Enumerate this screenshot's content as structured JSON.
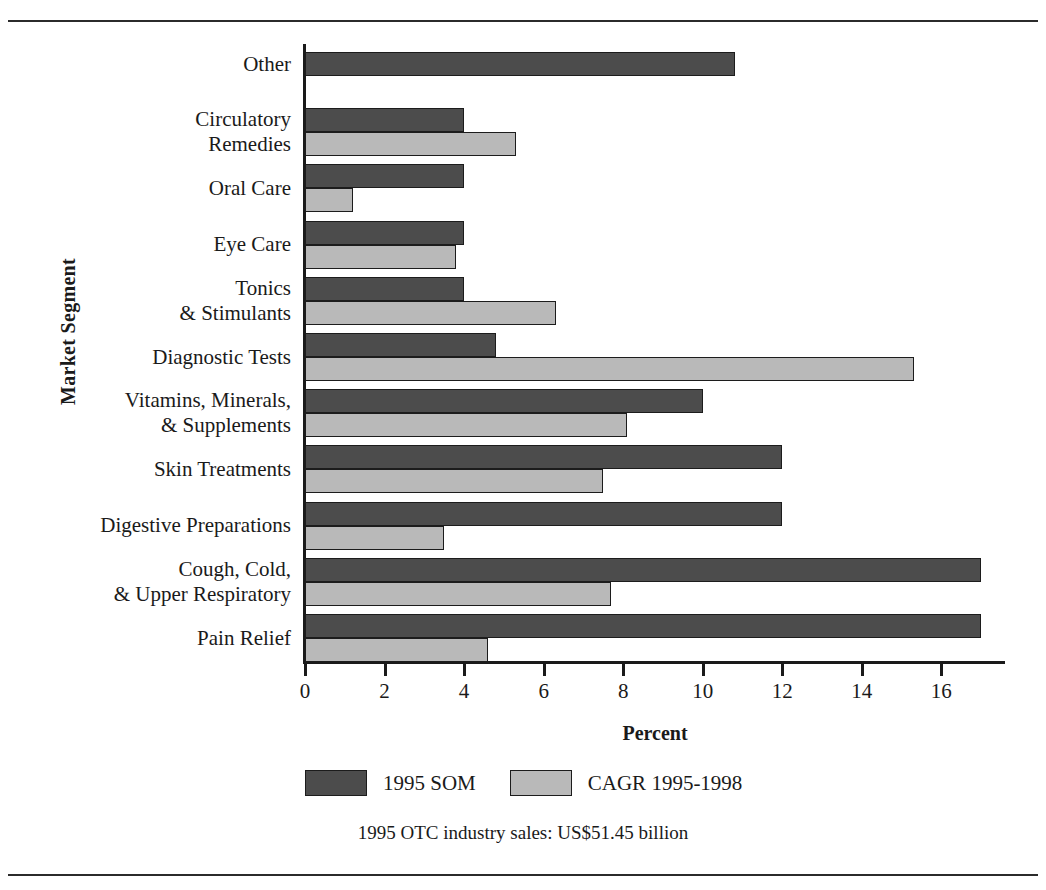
{
  "chart_data": {
    "type": "bar",
    "orientation": "horizontal",
    "title": "",
    "xlabel": "Percent",
    "ylabel": "Market Segment",
    "xlim": [
      0,
      17.6
    ],
    "xticks": [
      0,
      2,
      4,
      6,
      8,
      10,
      12,
      14,
      16
    ],
    "grid": false,
    "legend_position": "bottom",
    "categories": [
      "Other",
      "Circulatory\nRemedies",
      "Oral Care",
      "Eye Care",
      "Tonics\n& Stimulants",
      "Diagnostic Tests",
      "Vitamins, Minerals,\n& Supplements",
      "Skin Treatments",
      "Digestive Preparations",
      "Cough, Cold,\n& Upper Respiratory",
      "Pain Relief"
    ],
    "series": [
      {
        "name": "1995 SOM",
        "color": "#4c4c4c",
        "values": [
          10.8,
          4.0,
          4.0,
          4.0,
          4.0,
          4.8,
          10.0,
          12.0,
          12.0,
          17.0,
          17.0
        ]
      },
      {
        "name": "CAGR 1995-1998",
        "color": "#b9b9b9",
        "values": [
          null,
          5.3,
          1.2,
          3.8,
          6.3,
          15.3,
          8.1,
          7.5,
          3.5,
          7.7,
          4.6
        ]
      }
    ],
    "footnote": "1995 OTC industry sales: US$51.45 billion"
  },
  "legend": {
    "items": [
      {
        "label": "1995 SOM"
      },
      {
        "label": "CAGR 1995-1998"
      }
    ]
  }
}
